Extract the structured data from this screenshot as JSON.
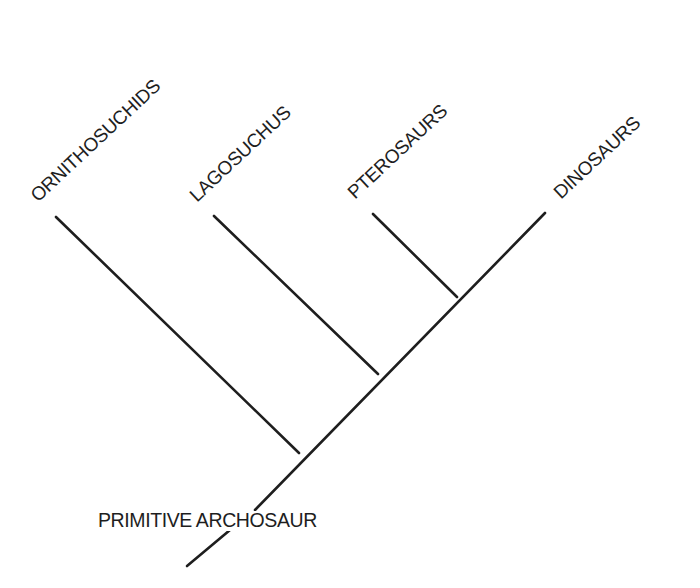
{
  "diagram": {
    "type": "cladogram",
    "taxa": [
      {
        "label": "ORNITHOSUCHIDS"
      },
      {
        "label": "LAGOSUCHUS"
      },
      {
        "label": "PTEROSAURS"
      },
      {
        "label": "DINOSAURS"
      }
    ],
    "root": {
      "label": "PRIMITIVE ARCHOSAUR"
    },
    "topology": "(ORNITHOSUCHIDS, (LAGOSUCHUS, (PTEROSAURS, DINOSAURS)))",
    "line_color": "#1e1e1e",
    "background": "#ffffff"
  }
}
